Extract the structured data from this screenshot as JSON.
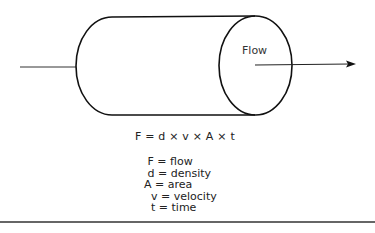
{
  "diagram": {
    "type": "pipe-flow",
    "flow_label": "Flow",
    "formula": "F = d × v × A × t",
    "legend": [
      {
        "symbol": "F",
        "meaning": "flow",
        "text": " F = flow"
      },
      {
        "symbol": "d",
        "meaning": "density",
        "text": " d = density"
      },
      {
        "symbol": "A",
        "meaning": "area",
        "text": "A = area"
      },
      {
        "symbol": "v",
        "meaning": "velocity",
        "text": "  v = velocity"
      },
      {
        "symbol": "t",
        "meaning": "time",
        "text": "  t = time"
      }
    ],
    "colors": {
      "stroke": "#111111",
      "background": "#ffffff",
      "rule": "#666666"
    }
  }
}
